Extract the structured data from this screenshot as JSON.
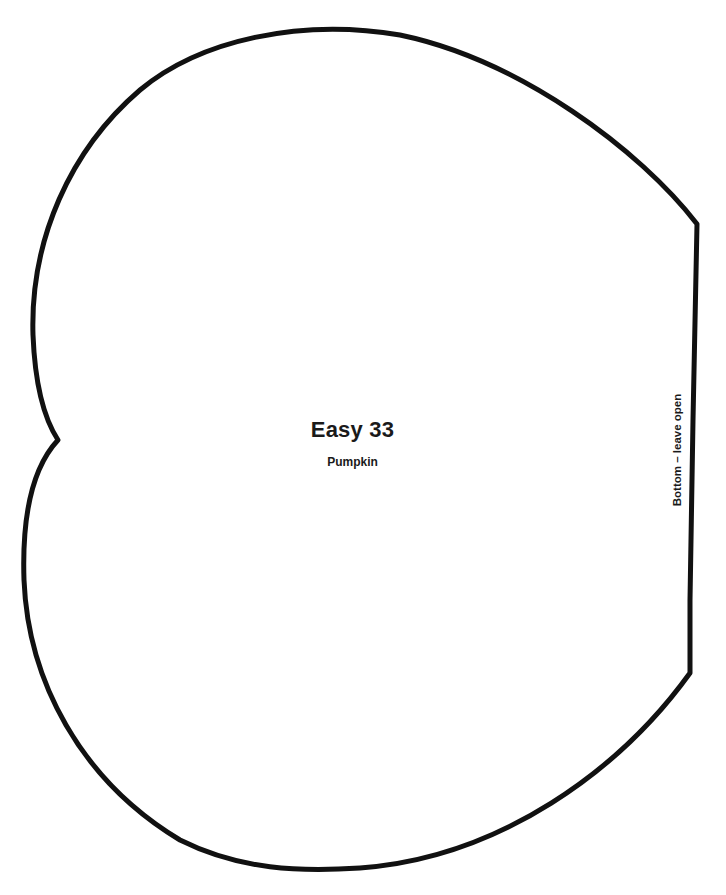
{
  "template": {
    "title": "Easy 33",
    "subtitle": "Pumpkin",
    "side_note": "Bottom – leave open",
    "outline_color": "#111111",
    "shape": "pumpkin-pattern-outline"
  }
}
